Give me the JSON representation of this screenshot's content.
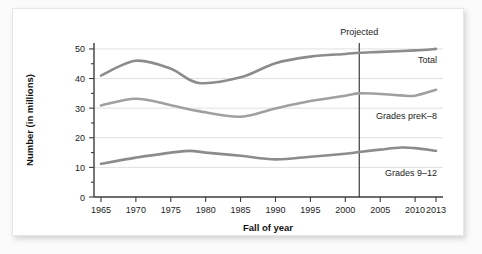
{
  "chart_data": {
    "type": "line",
    "title": "",
    "xlabel": "Fall of year",
    "ylabel": "Number (in millions)",
    "xlim": [
      1964,
      2014
    ],
    "ylim": [
      0,
      52
    ],
    "yticks": [
      0,
      10,
      20,
      30,
      40,
      50
    ],
    "ytick_labels": [
      "0",
      "10",
      "20",
      "30",
      "40",
      "50"
    ],
    "xticks": [
      1965,
      1970,
      1975,
      1980,
      1985,
      1990,
      1995,
      2000,
      2005,
      2010,
      2013
    ],
    "xtick_labels": [
      "1965",
      "1970",
      "1975",
      "1980",
      "1985",
      "1990",
      "1995",
      "2000",
      "2005",
      "2010",
      "2013"
    ],
    "grid": "horizontal-only",
    "legend_position": "inline-right-of-series",
    "annotations": [
      {
        "text": "Projected",
        "x": 2002,
        "type": "vertical-rule-with-label"
      }
    ],
    "series": [
      {
        "name": "Total",
        "label": "Total",
        "color": "#8c8c8c",
        "x": [
          1965,
          1970,
          1975,
          1979,
          1985,
          1990,
          1995,
          2000,
          2002,
          2005,
          2010,
          2013
        ],
        "values": [
          41.0,
          46.0,
          43.3,
          38.5,
          40.4,
          45.2,
          47.4,
          48.3,
          48.7,
          49.0,
          49.5,
          50.0
        ]
      },
      {
        "name": "Grades preK-8",
        "label": "Grades preK–8",
        "color": "#a0a0a0",
        "x": [
          1965,
          1970,
          1975,
          1979,
          1985,
          1990,
          1995,
          2000,
          2002,
          2005,
          2008,
          2010,
          2013
        ],
        "values": [
          30.9,
          33.2,
          31.0,
          29.0,
          27.1,
          29.9,
          32.4,
          34.2,
          35.0,
          34.8,
          34.3,
          34.2,
          36.2
        ]
      },
      {
        "name": "Grades 9-12",
        "label": "Grades 9–12",
        "color": "#8c8c8c",
        "x": [
          1965,
          1970,
          1977,
          1980,
          1985,
          1990,
          1995,
          2000,
          2002,
          2005,
          2008,
          2010,
          2013
        ],
        "values": [
          11.2,
          13.3,
          15.5,
          15.0,
          13.9,
          12.7,
          13.6,
          14.6,
          15.2,
          16.0,
          16.7,
          16.5,
          15.6
        ]
      }
    ]
  },
  "axes": {
    "y_title": "Number (in millions)",
    "x_title": "Fall of year"
  },
  "series_labels": {
    "total": "Total",
    "prek8": "Grades preK–8",
    "grades912": "Grades 9–12"
  },
  "annotation": {
    "projected": "Projected"
  }
}
